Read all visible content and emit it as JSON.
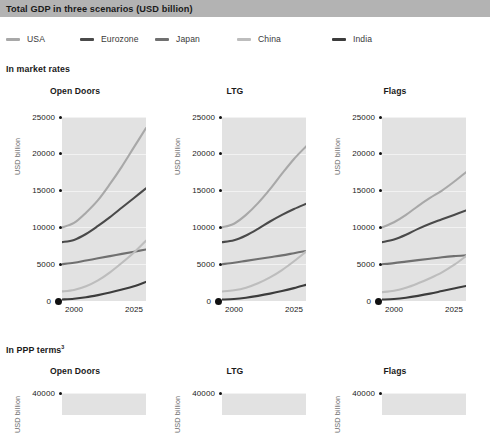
{
  "header": {
    "title": "Total GDP in three scenarios (USD billion)",
    "bar_color": "#b3b3b3"
  },
  "legend": {
    "items": [
      {
        "label": "USA",
        "color": "#a8a8a8",
        "x": 0
      },
      {
        "label": "Eurozone",
        "color": "#4a4a4a",
        "x": 74
      },
      {
        "label": "Japan",
        "color": "#707070",
        "x": 149
      },
      {
        "label": "China",
        "color": "#bdbdbd",
        "x": 231
      },
      {
        "label": "India",
        "color": "#3c3c3c",
        "x": 326
      }
    ]
  },
  "sections": [
    {
      "heading": "In market rates",
      "superscript": ""
    },
    {
      "heading": "In PPP terms",
      "superscript": "3"
    }
  ],
  "axis": {
    "y_label": "USD billion",
    "y_ticks_market": [
      "25000",
      "20000",
      "15000",
      "10000",
      "5000",
      "0"
    ],
    "y_ticks_ppp": [
      "40000"
    ],
    "x_ticks": [
      "2000",
      "2025"
    ]
  },
  "chart_data": [
    {
      "type": "line",
      "title": "Open Doors",
      "section": "In market rates",
      "xlabel": "",
      "ylabel": "USD billion",
      "xlim": [
        1995,
        2030
      ],
      "ylim": [
        0,
        25000
      ],
      "xticks": [
        2000,
        2025
      ],
      "yticks": [
        0,
        5000,
        10000,
        15000,
        20000,
        25000
      ],
      "grid": true,
      "legend_position": "top",
      "x": [
        1995,
        2000,
        2005,
        2010,
        2015,
        2020,
        2025,
        2030
      ],
      "series": [
        {
          "name": "USA",
          "color": "#a8a8a8",
          "values": [
            10000,
            10600,
            12000,
            13700,
            15900,
            18300,
            20900,
            23500
          ]
        },
        {
          "name": "Eurozone",
          "color": "#4a4a4a",
          "values": [
            8000,
            8300,
            9100,
            10200,
            11400,
            12700,
            14000,
            15300
          ]
        },
        {
          "name": "Japan",
          "color": "#707070",
          "values": [
            5000,
            5200,
            5500,
            5800,
            6100,
            6400,
            6700,
            7000
          ]
        },
        {
          "name": "China",
          "color": "#bdbdbd",
          "values": [
            1300,
            1500,
            2000,
            2800,
            3900,
            5200,
            6600,
            8200
          ]
        },
        {
          "name": "India",
          "color": "#3c3c3c",
          "values": [
            200,
            300,
            500,
            800,
            1150,
            1550,
            2000,
            2600
          ]
        }
      ]
    },
    {
      "type": "line",
      "title": "LTG",
      "section": "In market rates",
      "xlabel": "",
      "ylabel": "USD billion",
      "xlim": [
        1995,
        2030
      ],
      "ylim": [
        0,
        25000
      ],
      "xticks": [
        2000,
        2025
      ],
      "yticks": [
        0,
        5000,
        10000,
        15000,
        20000,
        25000
      ],
      "grid": true,
      "legend_position": "top",
      "x": [
        1995,
        2000,
        2005,
        2010,
        2015,
        2020,
        2025,
        2030
      ],
      "series": [
        {
          "name": "USA",
          "color": "#a8a8a8",
          "values": [
            10000,
            10500,
            11700,
            13300,
            15200,
            17300,
            19300,
            21000
          ]
        },
        {
          "name": "Eurozone",
          "color": "#4a4a4a",
          "values": [
            8000,
            8250,
            8900,
            9800,
            10800,
            11700,
            12500,
            13200
          ]
        },
        {
          "name": "Japan",
          "color": "#707070",
          "values": [
            5000,
            5200,
            5450,
            5700,
            5950,
            6200,
            6500,
            6800
          ]
        },
        {
          "name": "China",
          "color": "#bdbdbd",
          "values": [
            1300,
            1450,
            1800,
            2400,
            3200,
            4200,
            5400,
            6700
          ]
        },
        {
          "name": "India",
          "color": "#3c3c3c",
          "values": [
            200,
            280,
            450,
            700,
            1000,
            1350,
            1750,
            2200
          ]
        }
      ]
    },
    {
      "type": "line",
      "title": "Flags",
      "section": "In market rates",
      "xlabel": "",
      "ylabel": "USD billion",
      "xlim": [
        1995,
        2030
      ],
      "ylim": [
        0,
        25000
      ],
      "xticks": [
        2000,
        2025
      ],
      "yticks": [
        0,
        5000,
        10000,
        15000,
        20000,
        25000
      ],
      "grid": true,
      "legend_position": "top",
      "x": [
        1995,
        2000,
        2005,
        2010,
        2015,
        2020,
        2025,
        2030
      ],
      "series": [
        {
          "name": "USA",
          "color": "#a8a8a8",
          "values": [
            10000,
            10700,
            11700,
            12900,
            14000,
            15000,
            16200,
            17500
          ]
        },
        {
          "name": "Eurozone",
          "color": "#4a4a4a",
          "values": [
            8000,
            8350,
            9000,
            9800,
            10500,
            11100,
            11700,
            12300
          ]
        },
        {
          "name": "Japan",
          "color": "#707070",
          "values": [
            5000,
            5150,
            5350,
            5550,
            5750,
            5950,
            6100,
            6200
          ]
        },
        {
          "name": "China",
          "color": "#bdbdbd",
          "values": [
            1200,
            1400,
            1800,
            2400,
            3100,
            3900,
            4900,
            6100
          ]
        },
        {
          "name": "India",
          "color": "#3c3c3c",
          "values": [
            200,
            280,
            450,
            700,
            1000,
            1350,
            1700,
            2050
          ]
        }
      ]
    },
    {
      "type": "line",
      "title": "Open Doors",
      "section": "In PPP terms",
      "ylabel": "USD billion",
      "ylim": [
        0,
        40000
      ],
      "yticks": [
        40000
      ],
      "grid": true
    },
    {
      "type": "line",
      "title": "LTG",
      "section": "In PPP terms",
      "ylabel": "USD billion",
      "ylim": [
        0,
        40000
      ],
      "yticks": [
        40000
      ],
      "grid": true
    },
    {
      "type": "line",
      "title": "Flags",
      "section": "In PPP terms",
      "ylabel": "USD billion",
      "ylim": [
        0,
        40000
      ],
      "yticks": [
        40000
      ],
      "grid": true
    }
  ]
}
